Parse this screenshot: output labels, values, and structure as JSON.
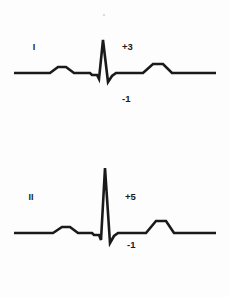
{
  "figure": {
    "background_color": "#fdfdfd",
    "trace_color": "#1a1a1a",
    "text_color": "#1b1b1b"
  },
  "chart_data": {
    "type": "line",
    "title": "",
    "xlabel": "",
    "ylabel": "",
    "grid": false,
    "legend_position": "inline-left",
    "units": "mV",
    "series": [
      {
        "name": "I",
        "lead_label": "I",
        "baseline_y": 73,
        "positive_amplitude_label": "+3",
        "positive_amplitude_value": 3,
        "negative_amplitude_label": "-1",
        "negative_amplitude_value": -1,
        "points": [
          [
            14,
            73
          ],
          [
            50,
            73
          ],
          [
            58,
            67
          ],
          [
            66,
            67
          ],
          [
            74,
            73
          ],
          [
            90,
            73
          ],
          [
            92,
            75
          ],
          [
            97,
            75
          ],
          [
            99,
            79
          ],
          [
            103,
            40
          ],
          [
            108,
            82
          ],
          [
            112,
            76
          ],
          [
            116,
            73
          ],
          [
            135,
            73
          ],
          [
            143,
            73
          ],
          [
            153,
            64
          ],
          [
            163,
            64
          ],
          [
            172,
            73
          ],
          [
            216,
            73
          ]
        ]
      },
      {
        "name": "II",
        "lead_label": "II",
        "baseline_y": 233,
        "positive_amplitude_label": "+5",
        "positive_amplitude_value": 5,
        "negative_amplitude_label": "-1",
        "negative_amplitude_value": -1,
        "points": [
          [
            14,
            233
          ],
          [
            53,
            233
          ],
          [
            62,
            227
          ],
          [
            70,
            227
          ],
          [
            78,
            233
          ],
          [
            92,
            233
          ],
          [
            94,
            235
          ],
          [
            99,
            235
          ],
          [
            101,
            240
          ],
          [
            105,
            168
          ],
          [
            110,
            243
          ],
          [
            114,
            236
          ],
          [
            118,
            233
          ],
          [
            138,
            233
          ],
          [
            146,
            233
          ],
          [
            156,
            221
          ],
          [
            166,
            221
          ],
          [
            174,
            233
          ],
          [
            216,
            233
          ]
        ]
      }
    ],
    "annotations": [
      {
        "text": "I",
        "x": 34,
        "y": 50,
        "series": "I",
        "role": "lead-name"
      },
      {
        "text": "+3",
        "x": 122,
        "y": 50,
        "series": "I",
        "role": "positive-amplitude"
      },
      {
        "text": "-1",
        "x": 122,
        "y": 102,
        "series": "I",
        "role": "negative-amplitude"
      },
      {
        "text": "II",
        "x": 31,
        "y": 200,
        "series": "II",
        "role": "lead-name"
      },
      {
        "text": "+5",
        "x": 125,
        "y": 200,
        "series": "II",
        "role": "positive-amplitude"
      },
      {
        "text": "-1",
        "x": 127,
        "y": 248,
        "series": "II",
        "role": "negative-amplitude"
      }
    ]
  }
}
